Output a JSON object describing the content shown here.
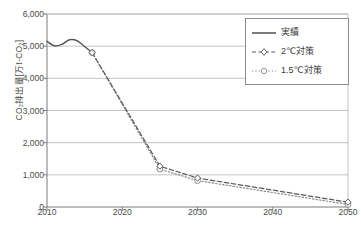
{
  "chart_data": {
    "type": "line",
    "title": "",
    "xlabel": "",
    "ylabel": "CO₂排出量[万t-CO₂]",
    "xlim": [
      2010,
      2050
    ],
    "ylim": [
      0,
      6000
    ],
    "grid": true,
    "legend_position": "top-right",
    "x_ticks": [
      2010,
      2020,
      2030,
      2040,
      2050
    ],
    "x_tick_labels": [
      "2010",
      "2020",
      "2030",
      "2040",
      "2050"
    ],
    "y_ticks": [
      0,
      1000,
      2000,
      3000,
      4000,
      5000,
      6000
    ],
    "y_tick_labels": [
      "0",
      "1,000",
      "2,000",
      "3,000",
      "4,000",
      "5,000",
      "6,000"
    ],
    "series": [
      {
        "name": "実績",
        "style": "solid",
        "marker": "none",
        "color": "#595959",
        "x": [
          2010,
          2011,
          2012,
          2013,
          2014,
          2015,
          2016
        ],
        "values": [
          5150,
          5010,
          5060,
          5200,
          5170,
          4990,
          4800
        ]
      },
      {
        "name": "2℃対策",
        "style": "dashed",
        "marker": "diamond",
        "color": "#595959",
        "x": [
          2016,
          2025,
          2030,
          2050
        ],
        "values": [
          4800,
          1270,
          900,
          150
        ]
      },
      {
        "name": "1.5℃対策",
        "style": "dotted",
        "marker": "circle",
        "color": "#8a8a8a",
        "x": [
          2016,
          2025,
          2030,
          2050
        ],
        "values": [
          4800,
          1180,
          820,
          80
        ]
      }
    ]
  },
  "legend": {
    "items": [
      {
        "label": "実績",
        "icon": "solid-line-icon"
      },
      {
        "label": "2℃対策",
        "icon": "dashed-line-diamond-icon"
      },
      {
        "label": "1.5℃対策",
        "icon": "dotted-line-circle-icon"
      }
    ]
  },
  "axis": {
    "y_title": "CO₂排出量[万t-CO₂]"
  },
  "colors": {
    "actual": "#595959",
    "two_degree": "#595959",
    "one_point_five_degree": "#8a8a8a",
    "grid": "#b4b4b4",
    "axis": "#7a7a7a",
    "text": "#4a4a4a"
  }
}
